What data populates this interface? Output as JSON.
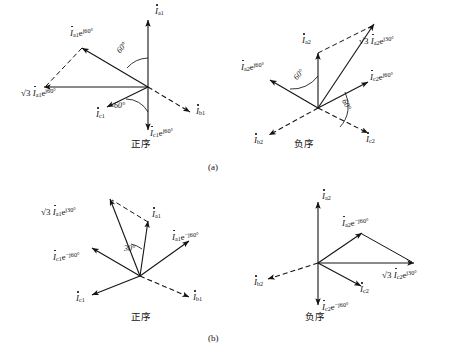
{
  "figure": {
    "width": 465,
    "height": 356,
    "background": "#ffffff",
    "ink_color": "#141414",
    "figure_letters": [
      {
        "text": "(a)",
        "x": 210,
        "y": 166
      },
      {
        "text": "(b)",
        "x": 210,
        "y": 336
      }
    ]
  },
  "panels": [
    {
      "id": "panel-a-positive",
      "name": "positive-sequence-delta-a",
      "caption": "正序",
      "caption_x": 132,
      "caption_y": 140,
      "origin": {
        "x": 148,
        "y": 87
      },
      "sequence": "positive",
      "angle_marks": [
        {
          "text": "60°",
          "x": 120,
          "y": 48,
          "rotate": -52
        },
        {
          "text": "60°",
          "x": 118,
          "y": 107,
          "rotate": 0
        }
      ],
      "phasors": [
        {
          "name": "i-a1",
          "label_html": "I<sub>a1</sub>",
          "label_x": 155,
          "label_y": 12,
          "style": "solid",
          "tip_x": 148,
          "tip_y": 18
        },
        {
          "name": "i-b1",
          "label_html": "I<sub>b1</sub>",
          "label_x": 196,
          "label_y": 112,
          "style": "dashed",
          "tip_x": 192,
          "tip_y": 112
        },
        {
          "name": "i-c1",
          "label_html": "I<sub>c1</sub>",
          "label_x": 100,
          "label_y": 113,
          "style": "solid",
          "tip_x": 105,
          "tip_y": 105
        },
        {
          "name": "i-a1-e-j60",
          "label_html": "I<sub>a1</sub>e<sup>j60°</sup>",
          "label_x": 74,
          "label_y": 33,
          "style": "solid",
          "tip_x": 80,
          "tip_y": 47
        },
        {
          "name": "i-c1-e-j60",
          "label_html": "I<sub>c1</sub>e<sup>j60°</sup>",
          "label_x": 152,
          "label_y": 131,
          "style": "solid",
          "tip_x": 148,
          "tip_y": 133
        },
        {
          "name": "sqrt3-i-a1-e-j60",
          "label_html": "I<sub>a1</sub>e<sup>j60°</sup>",
          "label_x": 48,
          "label_y": 90,
          "style": "dashed",
          "tip_x": 42,
          "tip_y": 87,
          "has_sqrt3": true
        }
      ]
    },
    {
      "id": "panel-a-negative",
      "name": "negative-sequence-delta-a",
      "caption": "负序",
      "caption_x": 295,
      "caption_y": 140,
      "origin": {
        "x": 318,
        "y": 108
      },
      "sequence": "negative",
      "angle_marks": [
        {
          "text": "60°",
          "x": 299,
          "y": 74,
          "rotate": -50
        },
        {
          "text": "60°",
          "x": 345,
          "y": 103,
          "rotate": 62
        }
      ],
      "phasors": [
        {
          "name": "i-a2",
          "label_html": "I<sub>a2</sub>",
          "label_x": 305,
          "label_y": 40,
          "style": "solid",
          "tip_x": 318,
          "tip_y": 51
        },
        {
          "name": "i-b2",
          "label_html": "I<sub>b2</sub>",
          "label_x": 258,
          "label_y": 140,
          "style": "dashed",
          "tip_x": 268,
          "tip_y": 136
        },
        {
          "name": "i-c2",
          "label_html": "I<sub>c2</sub>",
          "label_x": 368,
          "label_y": 140,
          "style": "dashed",
          "tip_x": 368,
          "tip_y": 135
        },
        {
          "name": "i-a2-e-j60",
          "label_html": "I<sub>a2</sub>e<sup>j60°</sup>",
          "label_x": 248,
          "label_y": 67,
          "style": "solid",
          "tip_x": 268,
          "tip_y": 78
        },
        {
          "name": "i-c2-e-j60",
          "label_html": "I<sub>c2</sub>e<sup>j60°</sup>",
          "label_x": 372,
          "label_y": 77,
          "style": "solid",
          "tip_x": 370,
          "tip_y": 80
        },
        {
          "name": "sqrt3-i-a2-e-j30",
          "label_html": "I<sub>a2</sub>e<sup>j30°</sup>",
          "label_x": 382,
          "label_y": 40,
          "style": "solid",
          "tip_x": 372,
          "tip_y": 22,
          "has_sqrt3": true
        }
      ]
    },
    {
      "id": "panel-b-positive",
      "name": "positive-sequence-delta-b",
      "caption": "正序",
      "caption_x": 132,
      "caption_y": 313,
      "origin": {
        "x": 140,
        "y": 276
      },
      "sequence": "positive",
      "angle_marks": [
        {
          "text": "30°",
          "x": 127,
          "y": 249,
          "rotate": 0
        }
      ],
      "phasors": [
        {
          "name": "i-a1",
          "label_html": "I<sub>a1</sub>",
          "label_x": 154,
          "label_y": 212,
          "style": "solid",
          "tip_x": 148,
          "tip_y": 222
        },
        {
          "name": "i-b1",
          "label_html": "I<sub>b1</sub>",
          "label_x": 196,
          "label_y": 299,
          "style": "dashed",
          "tip_x": 191,
          "tip_y": 297
        },
        {
          "name": "i-c1",
          "label_html": "I<sub>c1</sub>",
          "label_x": 80,
          "label_y": 298,
          "style": "solid",
          "tip_x": 90,
          "tip_y": 294
        },
        {
          "name": "i-a1-e-mj60",
          "label_html": "I<sub>a1</sub>e<sup>−j60°</sup>",
          "label_x": 176,
          "label_y": 237,
          "style": "solid",
          "tip_x": 190,
          "tip_y": 240
        },
        {
          "name": "i-c1-e-mj60",
          "label_html": "I<sub>c1</sub>e<sup>−j60°</sup>",
          "label_x": 58,
          "label_y": 256,
          "style": "solid",
          "tip_x": 90,
          "tip_y": 249
        },
        {
          "name": "sqrt3-i-a1-e-j30",
          "label_html": "I<sub>a1</sub>e<sup>j30°</sup>",
          "label_x": 64,
          "label_y": 211,
          "style": "dashed",
          "tip_x": 111,
          "tip_y": 198,
          "has_sqrt3": true
        }
      ]
    },
    {
      "id": "panel-b-negative",
      "name": "negative-sequence-delta-b",
      "caption": "负序",
      "caption_x": 307,
      "caption_y": 313,
      "origin": {
        "x": 318,
        "y": 263
      },
      "sequence": "negative",
      "angle_marks": [],
      "phasors": [
        {
          "name": "i-a2",
          "label_html": "I<sub>a2</sub>",
          "label_x": 324,
          "label_y": 196,
          "style": "solid",
          "tip_x": 318,
          "tip_y": 203
        },
        {
          "name": "i-b2",
          "label_html": "I<sub>b2</sub>",
          "label_x": 258,
          "label_y": 282,
          "style": "dashed",
          "tip_x": 268,
          "tip_y": 278
        },
        {
          "name": "i-c2",
          "label_html": "I<sub>c2</sub>",
          "label_x": 364,
          "label_y": 289,
          "style": "solid",
          "tip_x": 362,
          "tip_y": 285
        },
        {
          "name": "i-c2-e-mj60",
          "label_html": "I<sub>c2</sub>e<sup>−j60°</sup>",
          "label_x": 324,
          "label_y": 306,
          "style": "solid",
          "tip_x": 318,
          "tip_y": 308
        },
        {
          "name": "i-a2-e-mj60",
          "label_html": "I<sub>a2</sub>e<sup>−j60°</sup>",
          "label_x": 348,
          "label_y": 222,
          "style": "solid",
          "tip_x": 362,
          "tip_y": 234
        },
        {
          "name": "sqrt3-i-c2-e-j30",
          "label_html": "I<sub>c2</sub>e<sup>j30°</sup>",
          "label_x": 386,
          "label_y": 274,
          "style": "solid",
          "tip_x": 412,
          "tip_y": 263,
          "has_sqrt3": true
        }
      ]
    }
  ],
  "glyphs": {
    "sqrt3": "√3",
    "degree": "°",
    "j": "j",
    "minus": "−"
  }
}
